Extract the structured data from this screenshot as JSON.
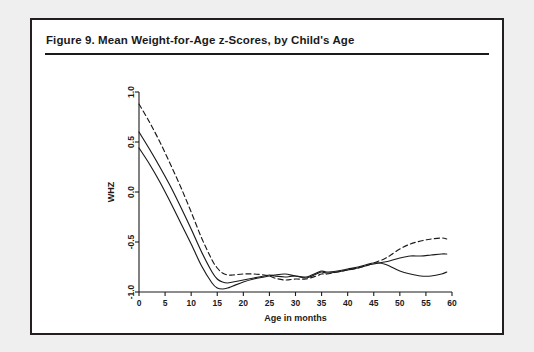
{
  "figure": {
    "title": "Figure 9.  Mean Weight-for-Age z-Scores, by Child's Age"
  },
  "chart_data": {
    "type": "line",
    "title": "Figure 9.  Mean Weight-for-Age z-Scores, by Child's Age",
    "xlabel": "Age in months",
    "ylabel": "WHZ",
    "xlim": [
      0,
      60
    ],
    "ylim": [
      -1.0,
      1.0
    ],
    "xticks": [
      0,
      5,
      10,
      15,
      20,
      25,
      30,
      35,
      40,
      45,
      50,
      55,
      60
    ],
    "xtick_labels": [
      "0",
      "5",
      "10",
      "15",
      "20",
      "25",
      "30",
      "35",
      "40",
      "45",
      "50",
      "55",
      "60"
    ],
    "yticks": [
      -1.0,
      -0.5,
      0.0,
      0.5,
      1.0
    ],
    "ytick_labels": [
      "-1.0",
      "-0.5",
      "0.0",
      "0.5",
      "1.0"
    ],
    "grid": false,
    "legend_position": "below",
    "x": [
      0,
      2,
      4,
      6,
      8,
      10,
      12,
      14,
      15,
      16,
      17,
      18,
      20,
      22,
      24,
      25,
      26,
      28,
      30,
      32,
      34,
      35,
      36,
      38,
      40,
      42,
      44,
      45,
      46,
      47,
      48,
      50,
      52,
      54,
      56,
      58,
      59
    ],
    "series": [
      {
        "name": "Total",
        "style": "solid",
        "color": "#1a1a1a",
        "values": [
          0.6,
          0.43,
          0.25,
          0.06,
          -0.15,
          -0.37,
          -0.6,
          -0.8,
          -0.87,
          -0.9,
          -0.91,
          -0.9,
          -0.88,
          -0.86,
          -0.84,
          -0.83,
          -0.84,
          -0.85,
          -0.84,
          -0.86,
          -0.82,
          -0.8,
          -0.81,
          -0.8,
          -0.78,
          -0.76,
          -0.73,
          -0.72,
          -0.71,
          -0.7,
          -0.69,
          -0.66,
          -0.64,
          -0.64,
          -0.63,
          -0.62,
          -0.62
        ]
      },
      {
        "name": "Men",
        "style": "solid",
        "color": "#1a1a1a",
        "values": [
          0.44,
          0.28,
          0.1,
          -0.1,
          -0.31,
          -0.52,
          -0.74,
          -0.91,
          -0.96,
          -0.97,
          -0.96,
          -0.94,
          -0.9,
          -0.87,
          -0.85,
          -0.84,
          -0.83,
          -0.82,
          -0.84,
          -0.85,
          -0.81,
          -0.79,
          -0.8,
          -0.79,
          -0.77,
          -0.75,
          -0.72,
          -0.71,
          -0.71,
          -0.72,
          -0.74,
          -0.79,
          -0.82,
          -0.84,
          -0.84,
          -0.82,
          -0.8
        ]
      },
      {
        "name": "Women",
        "style": "dashed",
        "color": "#1a1a1a",
        "values": [
          0.88,
          0.7,
          0.5,
          0.28,
          0.05,
          -0.2,
          -0.46,
          -0.68,
          -0.76,
          -0.81,
          -0.83,
          -0.83,
          -0.82,
          -0.82,
          -0.83,
          -0.84,
          -0.86,
          -0.88,
          -0.87,
          -0.87,
          -0.84,
          -0.82,
          -0.82,
          -0.8,
          -0.78,
          -0.76,
          -0.73,
          -0.71,
          -0.69,
          -0.67,
          -0.64,
          -0.57,
          -0.52,
          -0.49,
          -0.47,
          -0.46,
          -0.47
        ]
      }
    ],
    "legend": [
      {
        "label": "Total",
        "style": "solid"
      },
      {
        "label": "Men",
        "style": "solid"
      },
      {
        "label": "Women",
        "style": "dashed"
      }
    ]
  }
}
